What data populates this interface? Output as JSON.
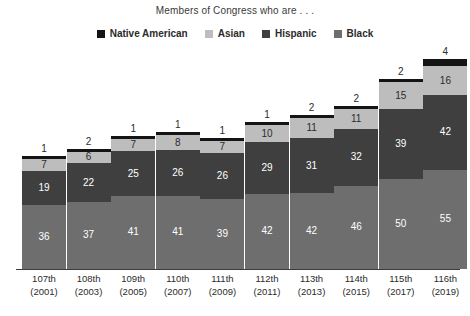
{
  "chart_data": {
    "type": "bar",
    "subtype": "stacked-bar",
    "title": "Members of Congress who are . . .",
    "xlabel": "",
    "ylabel": "",
    "grid": false,
    "legend_position": "top-center",
    "ylim": [
      0,
      117
    ],
    "categories": [
      "107th\n(2001)",
      "108th\n(2003)",
      "109th\n(2005)",
      "110th\n(2007)",
      "111th\n(2009)",
      "112th\n(2011)",
      "113th\n(2013)",
      "114th\n(2015)",
      "115th\n(2017)",
      "116th\n(2019)"
    ],
    "category_lines": [
      {
        "congress": "107th",
        "year": "(2001)"
      },
      {
        "congress": "108th",
        "year": "(2003)"
      },
      {
        "congress": "109th",
        "year": "(2005)"
      },
      {
        "congress": "110th",
        "year": "(2007)"
      },
      {
        "congress": "111th",
        "year": "(2009)"
      },
      {
        "congress": "112th",
        "year": "(2011)"
      },
      {
        "congress": "113th",
        "year": "(2013)"
      },
      {
        "congress": "114th",
        "year": "(2015)"
      },
      {
        "congress": "115th",
        "year": "(2017)"
      },
      {
        "congress": "116th",
        "year": "(2019)"
      }
    ],
    "series": [
      {
        "name": "Black",
        "color": "#6e6e6e",
        "values": [
          36,
          37,
          41,
          41,
          39,
          42,
          42,
          46,
          50,
          55
        ]
      },
      {
        "name": "Hispanic",
        "color": "#3f3f3f",
        "values": [
          19,
          22,
          25,
          26,
          26,
          29,
          31,
          32,
          39,
          42
        ]
      },
      {
        "name": "Asian",
        "color": "#bdbdbd",
        "values": [
          7,
          6,
          7,
          8,
          7,
          10,
          11,
          11,
          15,
          16
        ]
      },
      {
        "name": "Native American",
        "color": "#141414",
        "values": [
          1,
          2,
          1,
          1,
          1,
          1,
          2,
          2,
          2,
          4
        ]
      }
    ],
    "stack_totals": [
      63,
      67,
      74,
      76,
      73,
      82,
      86,
      91,
      106,
      117
    ]
  },
  "legend": {
    "items": [
      {
        "label": "Native American",
        "color": "#141414"
      },
      {
        "label": "Asian",
        "color": "#bdbdbd"
      },
      {
        "label": "Hispanic",
        "color": "#3f3f3f"
      },
      {
        "label": "Black",
        "color": "#6e6e6e"
      }
    ]
  },
  "colors": {
    "background": "#ffffff",
    "axis": "#3c3c3c",
    "text": "#2b2b2b",
    "black_series": "#6e6e6e",
    "hispanic_series": "#3f3f3f",
    "asian_series": "#bdbdbd",
    "native_series": "#141414"
  }
}
